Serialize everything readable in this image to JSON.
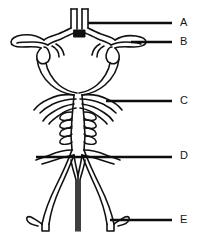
{
  "figure": {
    "type": "anatomical-line-diagram",
    "background_color": "#ffffff",
    "stroke_color": "#111111",
    "fill_color": "#ffffff",
    "leader_line_color": "#0d0d0d"
  },
  "labels": [
    {
      "id": "A",
      "text": "A",
      "text_x": 180,
      "text_y": 17,
      "leader": {
        "x1": 88,
        "y1": 23,
        "x2": 172,
        "y2": 23
      }
    },
    {
      "id": "B",
      "text": "B",
      "text_x": 180,
      "text_y": 36,
      "leader": {
        "x1": 131,
        "y1": 42,
        "x2": 172,
        "y2": 42
      }
    },
    {
      "id": "C",
      "text": "C",
      "text_x": 180,
      "text_y": 95,
      "leader": {
        "x1": 106,
        "y1": 101,
        "x2": 172,
        "y2": 101
      }
    },
    {
      "id": "D",
      "text": "D",
      "text_x": 180,
      "text_y": 150,
      "leader": {
        "x1": 36,
        "y1": 157,
        "x2": 172,
        "y2": 157
      }
    },
    {
      "id": "E",
      "text": "E",
      "text_x": 180,
      "text_y": 214,
      "leader": {
        "x1": 110,
        "y1": 220,
        "x2": 172,
        "y2": 220
      }
    }
  ],
  "diagram_parts": [
    {
      "name": "anterior-cerebral-arteries",
      "note": "two parallel vertical vessels at top center"
    },
    {
      "name": "anterior-communicating-artery",
      "note": "small filled black block joining the pair"
    },
    {
      "name": "middle-cerebral-arteries",
      "note": "horizontal vessels branching left and right"
    },
    {
      "name": "internal-carotid-arteries",
      "note": "loops below the middle cerebral arteries"
    },
    {
      "name": "posterior-communicating-arteries",
      "note": "small connecting loops"
    },
    {
      "name": "posterior-cerebral-arteries",
      "note": "vessels curving down from the circle"
    },
    {
      "name": "superior-cerebellar-arteries",
      "note": "paired branches below the circle"
    },
    {
      "name": "basilar-artery",
      "note": "central vertical trunk with paired pontine branches"
    },
    {
      "name": "pontine-branches",
      "note": "ladder-like short paired branches off the basilar artery"
    },
    {
      "name": "anterior-inferior-cerebellar-arteries",
      "note": "branches near mid basilar"
    },
    {
      "name": "vertebral-arteries",
      "note": "two vessels descending and diverging at the bottom"
    },
    {
      "name": "posterior-inferior-cerebellar-arteries",
      "note": "lateral branches at the vertebral junction"
    },
    {
      "name": "anterior-spinal-artery",
      "note": "V-shaped midline vessel descending between the vertebrals"
    }
  ]
}
